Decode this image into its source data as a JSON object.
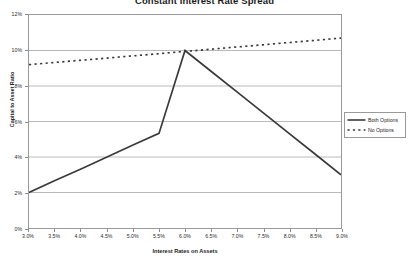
{
  "chart_data": {
    "type": "line",
    "title": "Constant Interest Rate Spread",
    "xlabel": "Interest Rates on Assets",
    "ylabel": "Capital to Asset Ratio",
    "x": [
      3.0,
      3.5,
      4.0,
      4.5,
      5.0,
      5.5,
      6.0,
      6.5,
      7.0,
      7.5,
      8.0,
      8.5,
      9.0
    ],
    "x_tick_labels": [
      "3.0%",
      "3.5%",
      "4.0%",
      "4.5%",
      "5.0%",
      "5.5%",
      "6.0%",
      "6.5%",
      "7.0%",
      "7.5%",
      "8.0%",
      "8.5%",
      "9.0%"
    ],
    "y_tick_labels": [
      "0%",
      "2%",
      "4%",
      "6%",
      "8%",
      "10%",
      "12%"
    ],
    "y_ticks": [
      0,
      2,
      4,
      6,
      8,
      10,
      12
    ],
    "xlim": [
      3.0,
      9.0
    ],
    "ylim": [
      0,
      12
    ],
    "grid": true,
    "legend_position": "right",
    "series": [
      {
        "name": "Both Options",
        "style": "solid",
        "color": "#3a3a3a",
        "values": [
          2.0,
          2.67,
          3.33,
          4.0,
          4.67,
          5.33,
          10.0,
          8.83,
          7.67,
          6.5,
          5.33,
          4.17,
          3.0
        ]
      },
      {
        "name": "No Options",
        "style": "dotted",
        "color": "#3a3a3a",
        "values": [
          9.2,
          9.33,
          9.45,
          9.57,
          9.7,
          9.82,
          9.95,
          10.07,
          10.2,
          10.32,
          10.45,
          10.57,
          10.7
        ]
      }
    ]
  },
  "legend": {
    "entries": [
      {
        "label": "Both Options"
      },
      {
        "label": "No Options"
      }
    ]
  },
  "colors": {
    "line": "#3a3a3a",
    "grid": "#b9b9b9",
    "frame": "#9a9a9a",
    "text": "#1c1c1c"
  }
}
